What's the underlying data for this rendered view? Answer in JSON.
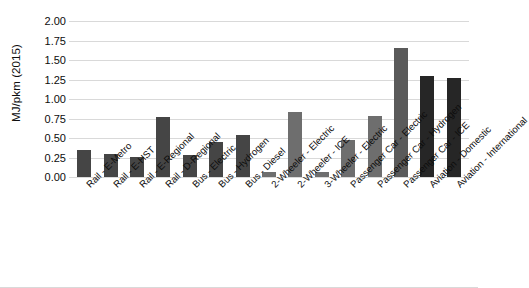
{
  "chart_data": {
    "type": "bar",
    "title": "",
    "xlabel": "",
    "ylabel": "MJ/pkm (2015)",
    "ylim": [
      0,
      2.0
    ],
    "ytick_step": 0.25,
    "grid": true,
    "legend": "none",
    "ytick_labels": [
      "2.00",
      "1.75",
      "1.50",
      "1.25",
      "1.00",
      "0.75",
      "0.50",
      "0.25",
      "0.00"
    ],
    "ytick_values": [
      2.0,
      1.75,
      1.5,
      1.25,
      1.0,
      0.75,
      0.5,
      0.25,
      0.0
    ],
    "categories": [
      "Rail - E-Metro",
      "Rail - E-HST",
      "Rail - E-Regional",
      "Rail - D-Regional",
      "Bus - Electric",
      "Bus - Hydrogen",
      "Bus - Diesel",
      "2-Wheeler - Electric",
      "2-Wheeler - ICE",
      "3-Wheeler - Electric",
      "Passenger Car - Electric",
      "Passenger Car - Hydrogen",
      "Passenger Car - ICE",
      "Aviation - Domestic",
      "Aviation - International"
    ],
    "values": [
      0.35,
      0.3,
      0.26,
      0.77,
      0.28,
      0.45,
      0.54,
      0.06,
      0.83,
      0.06,
      0.48,
      0.78,
      1.65,
      1.3,
      1.27
    ],
    "bar_colors": [
      "#454545",
      "#454545",
      "#454545",
      "#454545",
      "#454545",
      "#454545",
      "#454545",
      "#6e6e6e",
      "#6e6e6e",
      "#6e6e6e",
      "#6e6e6e",
      "#6e6e6e",
      "#5a5a5a",
      "#262626",
      "#262626"
    ]
  },
  "style": {
    "grid_color": "#d9d9d9",
    "text_color": "#0d0d0d",
    "background": "#ffffff"
  }
}
